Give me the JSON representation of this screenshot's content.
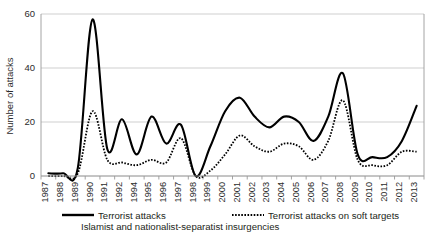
{
  "chart_data": {
    "type": "line",
    "title": "",
    "xlabel": "",
    "ylabel": "Number of attacks",
    "ylim": [
      0,
      60
    ],
    "yticks": [
      0,
      20,
      40,
      60
    ],
    "grid": true,
    "legend_position": "bottom",
    "categories": [
      "1987",
      "1988",
      "1989",
      "1990",
      "1991",
      "1992",
      "1994",
      "1995",
      "1996",
      "1997",
      "1998",
      "1999",
      "2000",
      "2001",
      "2002",
      "2003",
      "2004",
      "2005",
      "2006",
      "2007",
      "2008",
      "2009",
      "2010",
      "2011",
      "2012",
      "2013"
    ],
    "series": [
      {
        "name": "Terrorist attacks",
        "style": "solid",
        "color": "#000000",
        "values": [
          1,
          1,
          3,
          58,
          10,
          21,
          8,
          22,
          12,
          19,
          0,
          11,
          24,
          29,
          22,
          18,
          22,
          20,
          13,
          22,
          38,
          8,
          7,
          7,
          13,
          26
        ]
      },
      {
        "name": "Terrorist attacks on soft targets",
        "style": "dotted",
        "color": "#000000",
        "values": [
          0,
          0,
          1,
          24,
          6,
          5,
          4,
          6,
          5,
          14,
          0,
          2,
          8,
          15,
          11,
          9,
          12,
          11,
          6,
          13,
          28,
          6,
          4,
          4,
          9,
          9
        ]
      }
    ],
    "caption": "Islamist and nationalist-separatist insurgencies"
  },
  "legend": {
    "items": [
      {
        "label": "Terrorist attacks",
        "style": "solid"
      },
      {
        "label": "Terrorist attacks on soft targets",
        "style": "dotted"
      }
    ]
  }
}
